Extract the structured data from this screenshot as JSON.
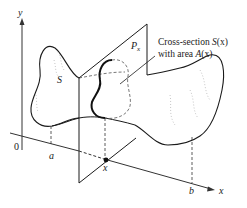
{
  "figure": {
    "labels": {
      "y_axis": "y",
      "x_axis": "x",
      "origin": "0",
      "a": "a",
      "b": "b",
      "x_point": "x",
      "solid": "S",
      "plane": "P",
      "plane_sub": "x",
      "cross_section_line1_prefix": "Cross-section ",
      "cross_section_line1_fn": "S",
      "cross_section_line1_arg": "(x)",
      "cross_section_line2_prefix": "with area ",
      "cross_section_line2_fn": "A",
      "cross_section_line2_arg": "(x)"
    },
    "colors": {
      "ink": "#1a1a1a",
      "axis": "#333333",
      "shading": "#b8b8b8",
      "background": "#ffffff"
    }
  }
}
